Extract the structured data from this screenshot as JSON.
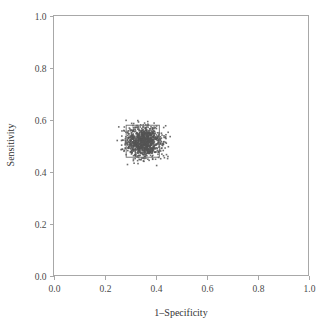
{
  "chart_data": {
    "type": "scatter",
    "title": "",
    "xlabel": "1–Specificity",
    "ylabel": "Sensitivity",
    "xlim": [
      0.0,
      1.0
    ],
    "ylim": [
      0.0,
      1.0
    ],
    "grid": false,
    "legend": null,
    "xticks": [
      "0.0",
      "0.2",
      "0.4",
      "0.6",
      "0.8",
      "1.0"
    ],
    "yticks": [
      "0.0",
      "0.2",
      "0.4",
      "0.6",
      "0.8",
      "1.0"
    ],
    "xtick_values": [
      0.0,
      0.2,
      0.4,
      0.6,
      0.8,
      1.0
    ],
    "ytick_values": [
      0.0,
      0.2,
      0.4,
      0.6,
      0.8,
      1.0
    ],
    "marker": {
      "shape": "square",
      "color": "#555555",
      "size_px": 1.6,
      "opacity": 0.85
    },
    "point_count": 1000,
    "cluster": {
      "center_x": 0.355,
      "center_y": 0.512,
      "sd_x": 0.034,
      "sd_y": 0.03,
      "x_range": [
        0.24,
        0.48
      ],
      "y_range": [
        0.42,
        0.64
      ]
    },
    "annotations": [
      {
        "name": "confidence-rectangle",
        "x0": 0.285,
        "x1": 0.415,
        "y0": 0.455,
        "y1": 0.578,
        "stroke": "#6b6b6b"
      }
    ],
    "series": [
      {
        "name": "bootstrap-replicates",
        "x": [
          0.355,
          0.341,
          0.372,
          0.318,
          0.389,
          0.362,
          0.33,
          0.401,
          0.347,
          0.368,
          0.312,
          0.395,
          0.358,
          0.334,
          0.381,
          0.35,
          0.326,
          0.41,
          0.365,
          0.343,
          0.377,
          0.305,
          0.392,
          0.356,
          0.339,
          0.384,
          0.353,
          0.321,
          0.406,
          0.37
        ],
        "y": [
          0.512,
          0.498,
          0.531,
          0.486,
          0.545,
          0.52,
          0.475,
          0.556,
          0.505,
          0.528,
          0.462,
          0.551,
          0.517,
          0.491,
          0.539,
          0.509,
          0.483,
          0.562,
          0.525,
          0.5,
          0.535,
          0.455,
          0.548,
          0.514,
          0.495,
          0.542,
          0.511,
          0.479,
          0.559,
          0.53
        ]
      }
    ]
  },
  "axes": {
    "x_title": "1–Specificity",
    "y_title": "Sensitivity"
  },
  "colors": {
    "frame": "#a8a8a8",
    "point": "#555555",
    "box": "#6b6b6b",
    "text": "#3a3a3a",
    "background": "#ffffff"
  }
}
